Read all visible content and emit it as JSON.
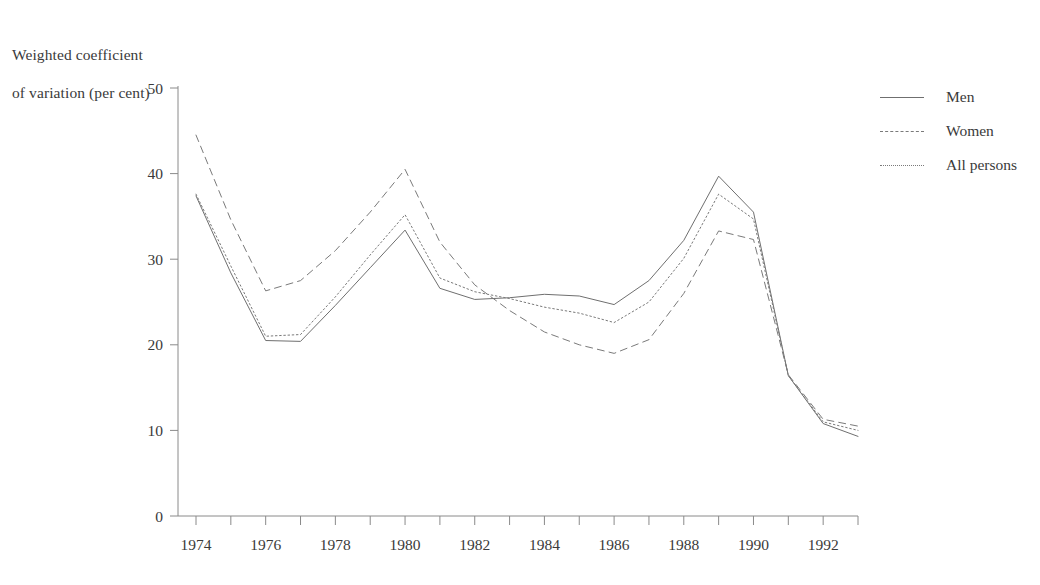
{
  "chart_data": {
    "type": "line",
    "title": "",
    "ylabel": "Weighted coefficient\nof variation (per cent)",
    "xlabel": "",
    "ylim": [
      0,
      50
    ],
    "xlim": [
      1974,
      1993
    ],
    "yticks": [
      0,
      10,
      20,
      30,
      40,
      50
    ],
    "ytick_labels": [
      "0",
      "10",
      "20",
      "30",
      "40",
      "50"
    ],
    "xticks": [
      1974,
      1975,
      1976,
      1977,
      1978,
      1979,
      1980,
      1981,
      1982,
      1983,
      1984,
      1985,
      1986,
      1987,
      1988,
      1989,
      1990,
      1991,
      1992,
      1993
    ],
    "xtick_labels": [
      "1974",
      "",
      "1976",
      "",
      "1978",
      "",
      "1980",
      "",
      "1982",
      "",
      "1984",
      "",
      "1986",
      "",
      "1988",
      "",
      "1990",
      "",
      "1992",
      ""
    ],
    "grid": false,
    "legend_position": "top-right",
    "x": [
      1974,
      1975,
      1976,
      1977,
      1978,
      1979,
      1980,
      1981,
      1982,
      1983,
      1984,
      1985,
      1986,
      1987,
      1988,
      1989,
      1990,
      1991,
      1992,
      1993
    ],
    "series": [
      {
        "name": "Men",
        "style": "solid",
        "color": "#6f6f6f",
        "values": [
          37.4,
          28.4,
          20.5,
          20.4,
          24.6,
          29.0,
          33.4,
          26.6,
          25.3,
          25.5,
          25.9,
          25.7,
          24.7,
          27.5,
          32.2,
          39.7,
          35.5,
          16.4,
          10.8,
          9.3
        ]
      },
      {
        "name": "Women",
        "style": "dashed",
        "color": "#7a7a7a",
        "values": [
          44.5,
          34.6,
          26.3,
          27.5,
          31.0,
          35.5,
          40.5,
          32.0,
          27.0,
          24.0,
          21.5,
          20.0,
          19.0,
          20.6,
          26.0,
          33.3,
          32.3,
          16.5,
          11.3,
          10.5
        ]
      },
      {
        "name": "All persons",
        "style": "dotted",
        "color": "#7a7a7a",
        "values": [
          37.6,
          29.2,
          21.0,
          21.2,
          25.6,
          30.5,
          35.2,
          27.8,
          26.2,
          25.4,
          24.4,
          23.7,
          22.6,
          25.0,
          30.1,
          37.6,
          34.7,
          16.4,
          11.0,
          10.0
        ]
      }
    ]
  },
  "axis_title": {
    "line1": "Weighted coefficient",
    "line2": "of variation (per cent)"
  },
  "legend": {
    "items": [
      {
        "label": "Men",
        "style": "solid"
      },
      {
        "label": "Women",
        "style": "dashed"
      },
      {
        "label": "All persons",
        "style": "dotted"
      }
    ]
  }
}
